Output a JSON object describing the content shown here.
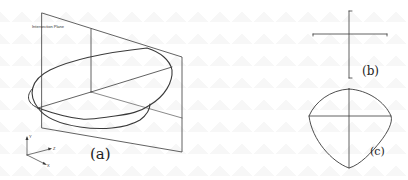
{
  "figure": {
    "panel_a": {
      "caption": "(a)",
      "plane_label": "Intersection Plane",
      "axes": {
        "y": "Y",
        "z": "Z",
        "x": "X"
      }
    },
    "panel_b": {
      "caption": "(b)"
    },
    "panel_c": {
      "caption": "(c)"
    },
    "colors": {
      "line": "#3a3a3a",
      "background": "#ffffff"
    }
  }
}
